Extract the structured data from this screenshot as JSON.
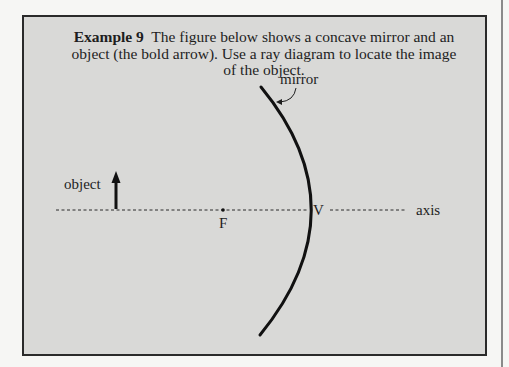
{
  "example": {
    "title": "Example 9",
    "text": "The figure below shows a concave mirror and an object (the bold arrow). Use a ray diagram to locate the image of the object."
  },
  "figure": {
    "labels": {
      "mirror": "mirror",
      "object": "object",
      "focal_point": "F",
      "vertex": "V",
      "axis": "axis"
    },
    "colors": {
      "box_background": "#d9d9d7",
      "ink": "#1e1e1e",
      "page_background": "#f6f6f4"
    }
  }
}
